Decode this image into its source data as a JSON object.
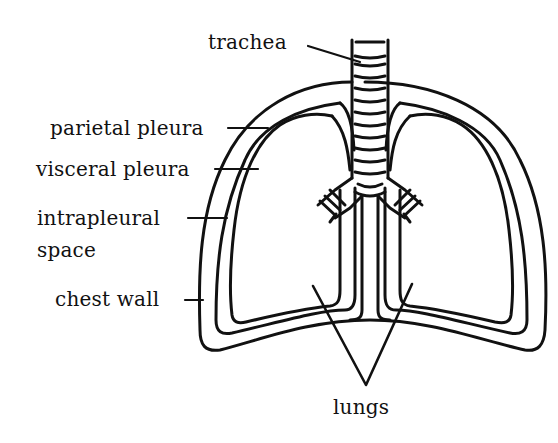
{
  "diagram": {
    "labels": {
      "trachea": "trachea",
      "parietal_pleura": "parietal pleura",
      "visceral_pleura": "visceral pleura",
      "intrapleural_line1": "intrapleural",
      "intrapleural_line2": "space",
      "chest_wall": "chest wall",
      "lungs": "lungs"
    },
    "colors": {
      "stroke": "#111111",
      "background": "#ffffff"
    }
  }
}
